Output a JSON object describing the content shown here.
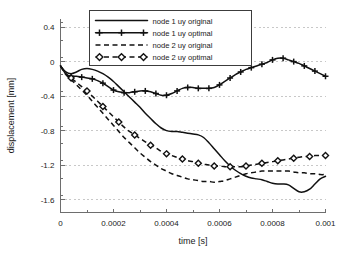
{
  "chart_data": {
    "type": "line",
    "title": "",
    "xlabel": "time [s]",
    "ylabel": "displacement [mm]",
    "xlim": [
      0,
      0.001
    ],
    "ylim": [
      -1.75,
      0.5
    ],
    "grid": true,
    "legend_position": "top-center",
    "xticks": [
      0,
      0.0002,
      0.0004,
      0.0006,
      0.0008,
      0.001
    ],
    "xtick_labels": [
      "0",
      "0.0002",
      "0.0004",
      "0.0006",
      "0.0008",
      "0.001"
    ],
    "yticks": [
      0.4,
      0,
      -0.4,
      -0.8,
      -1.2,
      -1.6
    ],
    "ytick_labels": [
      "0.4",
      "0",
      "-0.4",
      "-0.8",
      "-1.2",
      "-1.6"
    ],
    "x_minor_tick_step": 0.0001,
    "y_minor_tick_step": 0.2,
    "series": [
      {
        "name": "node 1 uy original",
        "style": "solid",
        "marker": "none",
        "color": "#111111",
        "x": [
          0.0,
          2e-05,
          4e-05,
          6e-05,
          8e-05,
          0.0001,
          0.00012,
          0.00014,
          0.00016,
          0.00018,
          0.0002,
          0.00022,
          0.00024,
          0.00026,
          0.00028,
          0.0003,
          0.00032,
          0.00034,
          0.00036,
          0.00038,
          0.0004,
          0.00042,
          0.00044,
          0.00046,
          0.00048,
          0.0005,
          0.00052,
          0.00054,
          0.00056,
          0.00058,
          0.0006,
          0.00062,
          0.00064,
          0.00066,
          0.00068,
          0.0007,
          0.00072,
          0.00074,
          0.00076,
          0.00078,
          0.0008,
          0.00082,
          0.00084,
          0.00086,
          0.00088,
          0.0009,
          0.00092,
          0.00094,
          0.00096,
          0.00098,
          0.001
        ],
        "y": [
          -0.05,
          -0.12,
          -0.14,
          -0.12,
          -0.09,
          -0.08,
          -0.09,
          -0.11,
          -0.14,
          -0.18,
          -0.23,
          -0.29,
          -0.35,
          -0.41,
          -0.47,
          -0.53,
          -0.6,
          -0.66,
          -0.72,
          -0.77,
          -0.8,
          -0.81,
          -0.81,
          -0.82,
          -0.83,
          -0.84,
          -0.85,
          -0.88,
          -0.94,
          -1.01,
          -1.08,
          -1.15,
          -1.21,
          -1.26,
          -1.3,
          -1.33,
          -1.35,
          -1.36,
          -1.37,
          -1.39,
          -1.41,
          -1.42,
          -1.42,
          -1.43,
          -1.47,
          -1.51,
          -1.51,
          -1.48,
          -1.42,
          -1.36,
          -1.33
        ]
      },
      {
        "name": "node 1 uy optimal",
        "style": "solid",
        "marker": "plus",
        "color": "#111111",
        "x": [
          0.0,
          2e-05,
          4e-05,
          6e-05,
          8e-05,
          0.0001,
          0.00012,
          0.00014,
          0.00016,
          0.00018,
          0.0002,
          0.00022,
          0.00024,
          0.00026,
          0.00028,
          0.0003,
          0.00032,
          0.00034,
          0.00036,
          0.00038,
          0.0004,
          0.00042,
          0.00044,
          0.00046,
          0.00048,
          0.0005,
          0.00052,
          0.00054,
          0.00056,
          0.00058,
          0.0006,
          0.00062,
          0.00064,
          0.00066,
          0.00068,
          0.0007,
          0.00072,
          0.00074,
          0.00076,
          0.00078,
          0.0008,
          0.00082,
          0.00084,
          0.00086,
          0.00088,
          0.0009,
          0.00092,
          0.00094,
          0.00096,
          0.00098,
          0.001
        ],
        "y": [
          -0.05,
          -0.14,
          -0.17,
          -0.17,
          -0.18,
          -0.19,
          -0.2,
          -0.22,
          -0.25,
          -0.29,
          -0.33,
          -0.35,
          -0.36,
          -0.36,
          -0.35,
          -0.34,
          -0.34,
          -0.35,
          -0.37,
          -0.39,
          -0.39,
          -0.37,
          -0.34,
          -0.31,
          -0.3,
          -0.3,
          -0.31,
          -0.31,
          -0.31,
          -0.3,
          -0.27,
          -0.23,
          -0.19,
          -0.15,
          -0.12,
          -0.09,
          -0.07,
          -0.05,
          -0.03,
          -0.01,
          0.02,
          0.04,
          0.04,
          0.02,
          0.0,
          -0.02,
          -0.05,
          -0.08,
          -0.11,
          -0.14,
          -0.17
        ]
      },
      {
        "name": "node 2 uy original",
        "style": "dashed",
        "marker": "none",
        "color": "#111111",
        "x": [
          0.0,
          2e-05,
          4e-05,
          6e-05,
          8e-05,
          0.0001,
          0.00012,
          0.00014,
          0.00016,
          0.00018,
          0.0002,
          0.00022,
          0.00024,
          0.00026,
          0.00028,
          0.0003,
          0.00032,
          0.00034,
          0.00036,
          0.00038,
          0.0004,
          0.00042,
          0.00044,
          0.00046,
          0.00048,
          0.0005,
          0.00052,
          0.00054,
          0.00056,
          0.00058,
          0.0006,
          0.00062,
          0.00064,
          0.00066,
          0.00068,
          0.0007,
          0.00072,
          0.00074,
          0.00076,
          0.00078,
          0.0008,
          0.00082,
          0.00084,
          0.00086,
          0.00088,
          0.0009,
          0.00092,
          0.00094,
          0.00096,
          0.00098,
          0.001
        ],
        "y": [
          -0.05,
          -0.15,
          -0.21,
          -0.27,
          -0.33,
          -0.39,
          -0.46,
          -0.53,
          -0.6,
          -0.67,
          -0.74,
          -0.81,
          -0.88,
          -0.94,
          -1.0,
          -1.06,
          -1.11,
          -1.16,
          -1.2,
          -1.24,
          -1.27,
          -1.3,
          -1.32,
          -1.34,
          -1.36,
          -1.37,
          -1.38,
          -1.39,
          -1.39,
          -1.4,
          -1.39,
          -1.38,
          -1.36,
          -1.34,
          -1.32,
          -1.3,
          -1.29,
          -1.28,
          -1.27,
          -1.27,
          -1.27,
          -1.27,
          -1.27,
          -1.27,
          -1.28,
          -1.29,
          -1.29,
          -1.3,
          -1.3,
          -1.31,
          -1.31
        ]
      },
      {
        "name": "node 2 uy optimal",
        "style": "dashed",
        "marker": "diamond",
        "color": "#111111",
        "x": [
          0.0,
          2e-05,
          4e-05,
          6e-05,
          8e-05,
          0.0001,
          0.00012,
          0.00014,
          0.00016,
          0.00018,
          0.0002,
          0.00022,
          0.00024,
          0.00026,
          0.00028,
          0.0003,
          0.00032,
          0.00034,
          0.00036,
          0.00038,
          0.0004,
          0.00042,
          0.00044,
          0.00046,
          0.00048,
          0.0005,
          0.00052,
          0.00054,
          0.00056,
          0.00058,
          0.0006,
          0.00062,
          0.00064,
          0.00066,
          0.00068,
          0.0007,
          0.00072,
          0.00074,
          0.00076,
          0.00078,
          0.0008,
          0.00082,
          0.00084,
          0.00086,
          0.00088,
          0.0009,
          0.00092,
          0.00094,
          0.00096,
          0.00098,
          0.001
        ],
        "y": [
          -0.05,
          -0.14,
          -0.19,
          -0.24,
          -0.29,
          -0.34,
          -0.4,
          -0.46,
          -0.52,
          -0.58,
          -0.64,
          -0.7,
          -0.76,
          -0.81,
          -0.85,
          -0.89,
          -0.93,
          -0.97,
          -1.0,
          -1.04,
          -1.07,
          -1.09,
          -1.11,
          -1.13,
          -1.15,
          -1.16,
          -1.18,
          -1.19,
          -1.2,
          -1.21,
          -1.21,
          -1.22,
          -1.22,
          -1.22,
          -1.22,
          -1.21,
          -1.2,
          -1.19,
          -1.18,
          -1.17,
          -1.16,
          -1.15,
          -1.14,
          -1.13,
          -1.12,
          -1.11,
          -1.1,
          -1.1,
          -1.09,
          -1.09,
          -1.09
        ]
      }
    ]
  },
  "legend": {
    "entries": [
      {
        "label": "node 1 uy original"
      },
      {
        "label": "node 1 uy optimal"
      },
      {
        "label": "node 2 uy original"
      },
      {
        "label": "node 2 uy optimal"
      }
    ]
  }
}
